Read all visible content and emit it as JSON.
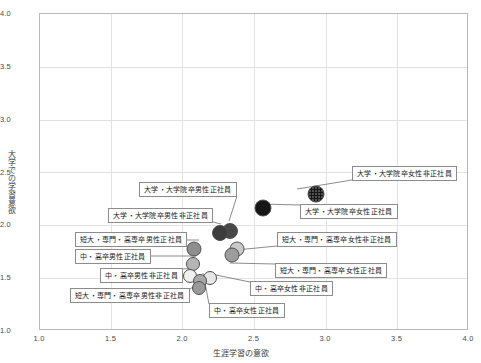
{
  "chart_data": {
    "type": "scatter",
    "title": "",
    "xlabel": "生涯学習の意欲",
    "ylabel": "大学での学習意欲",
    "xlim": [
      1.0,
      4.0
    ],
    "ylim": [
      1.0,
      4.0
    ],
    "xticks": [
      "1.0",
      "1.5",
      "2.0",
      "2.5",
      "3.0",
      "3.5",
      "4.0"
    ],
    "yticks": [
      "1.0",
      "1.5",
      "2.0",
      "2.5",
      "3.0",
      "3.5",
      "4.0"
    ],
    "grid": true,
    "legend": "none (points labelled with callout boxes)",
    "points": [
      {
        "label": "大学・大学院卒女性非正社員",
        "x": 2.93,
        "y": 2.3,
        "color": "#161616",
        "pattern": "dotted",
        "size": 17
      },
      {
        "label": "大学・大学院卒女性正社員",
        "x": 2.56,
        "y": 2.16,
        "color": "#161616",
        "pattern": "solid",
        "size": 17
      },
      {
        "label": "大学・大学院卒男性正社員",
        "x": 2.33,
        "y": 1.95,
        "color": "#474747",
        "pattern": "solid",
        "size": 16
      },
      {
        "label": "大学・大学院卒男性非正社員",
        "x": 2.26,
        "y": 1.93,
        "color": "#3c3c3c",
        "pattern": "solid",
        "size": 16
      },
      {
        "label": "短大・専門・高専卒男性正社員",
        "x": 2.08,
        "y": 1.78,
        "color": "#8e8e8e",
        "pattern": "solid",
        "size": 15
      },
      {
        "label": "短大・専門・高専卒女性非正社員",
        "x": 2.38,
        "y": 1.78,
        "color": "#c9c9c9",
        "pattern": "solid",
        "size": 15
      },
      {
        "label": "短大・専門・高専卒女性正社員",
        "x": 2.34,
        "y": 1.72,
        "color": "#9d9d9d",
        "pattern": "solid",
        "size": 15
      },
      {
        "label": "中・高卒男性正社員",
        "x": 2.07,
        "y": 1.63,
        "color": "#b5b5b5",
        "pattern": "solid",
        "size": 14
      },
      {
        "label": "中・高卒男性非正社員",
        "x": 2.05,
        "y": 1.52,
        "color": "#f0f0f0",
        "pattern": "solid",
        "size": 14
      },
      {
        "label": "中・高卒女性非正社員",
        "x": 2.19,
        "y": 1.5,
        "color": "#e6e6e6",
        "pattern": "solid",
        "size": 14
      },
      {
        "label": "中・高卒女性正社員",
        "x": 2.12,
        "y": 1.47,
        "color": "#a8a8a8",
        "pattern": "solid",
        "size": 14
      },
      {
        "label": "短大・専門・高専卒男性非正社員",
        "x": 2.11,
        "y": 1.41,
        "color": "#9a9a9a",
        "pattern": "solid",
        "size": 14
      }
    ]
  },
  "callouts": [
    {
      "name": "callout-univ-female-nonregular",
      "text": "大学・大学院卒女性非正社員",
      "left": 352,
      "top": 166,
      "anchor_x": 297,
      "anchor_y": 189
    },
    {
      "name": "callout-univ-female-regular",
      "text": "大学・大学院卒女性正社員",
      "left": 300,
      "top": 204,
      "anchor_x": 260,
      "anchor_y": 204
    },
    {
      "name": "callout-univ-male-regular",
      "text": "大学・大学院卒男性正社員",
      "left": 139,
      "top": 182,
      "anchor_x": 229,
      "anchor_y": 221
    },
    {
      "name": "callout-univ-male-nonregular",
      "text": "大学・大学院卒男性非正社員",
      "left": 108,
      "top": 208,
      "anchor_x": 221,
      "anchor_y": 224
    },
    {
      "name": "callout-college-male-regular",
      "text": "短大・専門・高専卒男性正社員",
      "left": 75,
      "top": 232,
      "anchor_x": 199,
      "anchor_y": 240
    },
    {
      "name": "callout-hs-male-regular",
      "text": "中・高卒男性正社員",
      "left": 75,
      "top": 249,
      "anchor_x": 196,
      "anchor_y": 256
    },
    {
      "name": "callout-hs-male-nonregular",
      "text": "中・高卒男性非正社員",
      "left": 100,
      "top": 268,
      "anchor_x": 193,
      "anchor_y": 268
    },
    {
      "name": "callout-college-male-nonregular",
      "text": "短大・専門・高専卒男性非正社員",
      "left": 70,
      "top": 288,
      "anchor_x": 202,
      "anchor_y": 281
    },
    {
      "name": "callout-hs-female-regular",
      "text": "中・高卒女性正社員",
      "left": 209,
      "top": 303,
      "anchor_x": 203,
      "anchor_y": 273
    },
    {
      "name": "callout-hs-female-nonregular",
      "text": "中・高卒女性非正社員",
      "left": 250,
      "top": 281,
      "anchor_x": 211,
      "anchor_y": 274
    },
    {
      "name": "callout-college-female-regular",
      "text": "短大・専門・高専卒女性正社員",
      "left": 275,
      "top": 263,
      "anchor_x": 230,
      "anchor_y": 263
    },
    {
      "name": "callout-college-female-nonregular",
      "text": "短大・専門・高専卒女性非正社員",
      "left": 277,
      "top": 232,
      "anchor_x": 236,
      "anchor_y": 250
    }
  ]
}
